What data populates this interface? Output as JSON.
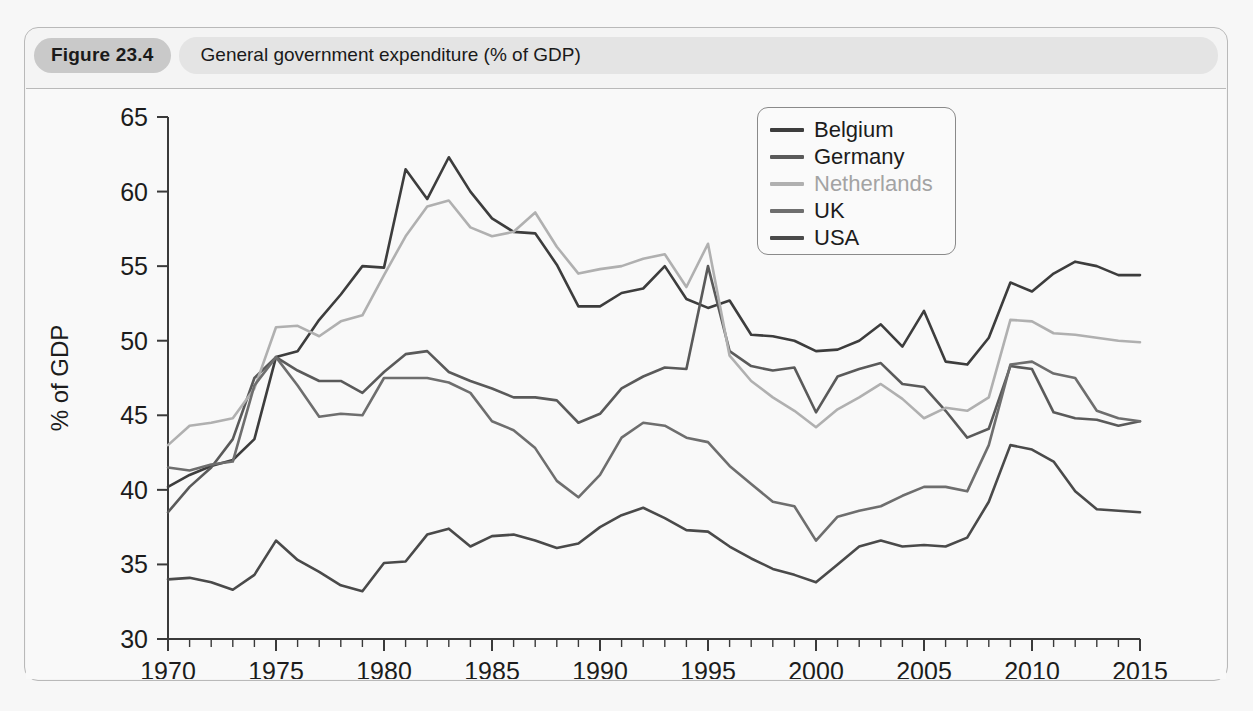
{
  "figure": {
    "number_label": "Figure 23.4",
    "title": "General government expenditure (% of GDP)"
  },
  "legend": {
    "position": "top-right",
    "entries": [
      {
        "label": "Belgium",
        "color": "#3d3d3d"
      },
      {
        "label": "Germany",
        "color": "#5a5a5a"
      },
      {
        "label": "Netherlands",
        "color": "#b0b0b0"
      },
      {
        "label": "UK",
        "color": "#6e6e6e"
      },
      {
        "label": "USA",
        "color": "#4a4a4a"
      }
    ]
  },
  "chart_data": {
    "type": "line",
    "title": "General government expenditure (% of GDP)",
    "xlabel": "",
    "ylabel": "% of GDP",
    "xlim": [
      1970,
      2015
    ],
    "ylim": [
      30,
      65
    ],
    "ytick_labels": [
      "30",
      "35",
      "40",
      "45",
      "50",
      "55",
      "60",
      "65"
    ],
    "yticks": [
      30,
      35,
      40,
      45,
      50,
      55,
      60,
      65
    ],
    "xtick_labels": [
      "1970",
      "1975",
      "1980",
      "1985",
      "1990",
      "1995",
      "2000",
      "2005",
      "2010",
      "2015"
    ],
    "xticks": [
      1970,
      1975,
      1980,
      1985,
      1990,
      1995,
      2000,
      2005,
      2010,
      2015
    ],
    "minor_xtick_step": 1,
    "grid": false,
    "x": [
      1970,
      1971,
      1972,
      1973,
      1974,
      1975,
      1976,
      1977,
      1978,
      1979,
      1980,
      1981,
      1982,
      1983,
      1984,
      1985,
      1986,
      1987,
      1988,
      1989,
      1990,
      1991,
      1992,
      1993,
      1994,
      1995,
      1996,
      1997,
      1998,
      1999,
      2000,
      2001,
      2002,
      2003,
      2004,
      2005,
      2006,
      2007,
      2008,
      2009,
      2010,
      2011,
      2012,
      2013,
      2014,
      2015
    ],
    "series": [
      {
        "name": "Belgium",
        "color": "#3d3d3d",
        "values": [
          40.2,
          41.0,
          41.6,
          42.0,
          43.4,
          48.9,
          49.3,
          51.4,
          53.1,
          55.0,
          54.9,
          61.5,
          59.5,
          62.3,
          60.0,
          58.2,
          57.3,
          57.2,
          55.1,
          52.3,
          52.3,
          53.2,
          53.5,
          55.0,
          52.8,
          52.2,
          52.7,
          50.4,
          50.3,
          50.0,
          49.3,
          49.4,
          50.0,
          51.1,
          49.6,
          52.0,
          48.6,
          48.4,
          50.2,
          53.9,
          53.3,
          54.5,
          55.3,
          55.0,
          54.4,
          54.4
        ]
      },
      {
        "name": "Germany",
        "color": "#5a5a5a",
        "values": [
          38.5,
          40.2,
          41.5,
          43.4,
          47.5,
          48.9,
          48.0,
          47.3,
          47.3,
          46.5,
          47.9,
          49.1,
          49.3,
          47.9,
          47.3,
          46.8,
          46.2,
          46.2,
          46.0,
          44.5,
          45.1,
          46.8,
          47.6,
          48.2,
          48.1,
          55.0,
          49.3,
          48.3,
          48.0,
          48.2,
          45.2,
          47.6,
          48.1,
          48.5,
          47.1,
          46.9,
          45.3,
          43.5,
          44.1,
          48.3,
          48.1,
          45.2,
          44.8,
          44.7,
          44.3,
          44.6
        ]
      },
      {
        "name": "Netherlands",
        "color": "#b0b0b0",
        "values": [
          43.0,
          44.3,
          44.5,
          44.8,
          46.8,
          50.9,
          51.0,
          50.3,
          51.3,
          51.7,
          54.4,
          57.0,
          59.0,
          59.4,
          57.6,
          57.0,
          57.3,
          58.6,
          56.3,
          54.5,
          54.8,
          55.0,
          55.5,
          55.8,
          53.6,
          56.5,
          49.0,
          47.3,
          46.2,
          45.3,
          44.2,
          45.4,
          46.2,
          47.1,
          46.1,
          44.8,
          45.5,
          45.3,
          46.2,
          51.4,
          51.3,
          50.5,
          50.4,
          50.2,
          50.0,
          49.9
        ]
      },
      {
        "name": "UK",
        "color": "#6e6e6e",
        "values": [
          41.5,
          41.3,
          41.7,
          41.9,
          47.0,
          48.9,
          47.0,
          44.9,
          45.1,
          45.0,
          47.5,
          47.5,
          47.5,
          47.2,
          46.5,
          44.6,
          44.0,
          42.8,
          40.6,
          39.5,
          41.0,
          43.5,
          44.5,
          44.3,
          43.5,
          43.2,
          41.6,
          40.4,
          39.2,
          38.9,
          36.6,
          38.2,
          38.6,
          38.9,
          39.6,
          40.2,
          40.2,
          39.9,
          43.0,
          48.4,
          48.6,
          47.8,
          47.5,
          45.3,
          44.8,
          44.6
        ]
      },
      {
        "name": "USA",
        "color": "#4a4a4a",
        "values": [
          34.0,
          34.1,
          33.8,
          33.3,
          34.3,
          36.6,
          35.3,
          34.5,
          33.6,
          33.2,
          35.1,
          35.2,
          37.0,
          37.4,
          36.2,
          36.9,
          37.0,
          36.6,
          36.1,
          36.4,
          37.5,
          38.3,
          38.8,
          38.1,
          37.3,
          37.2,
          36.2,
          35.4,
          34.7,
          34.3,
          33.8,
          35.0,
          36.2,
          36.6,
          36.2,
          36.3,
          36.2,
          36.8,
          39.2,
          43.0,
          42.7,
          41.9,
          39.9,
          38.7,
          38.6,
          38.5
        ]
      }
    ]
  }
}
